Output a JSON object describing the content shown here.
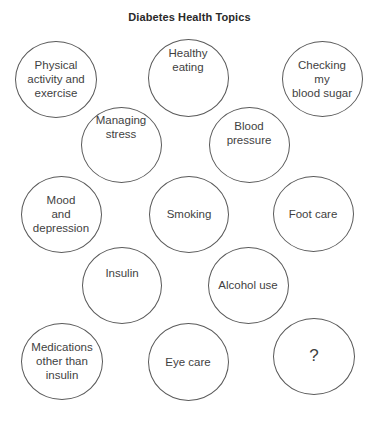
{
  "title": "Diabetes Health Topics",
  "colors": {
    "background": "#ffffff",
    "circle_stroke": "#5a5a5a",
    "text": "#3f3f3f",
    "title": "#2a2a2a"
  },
  "topics": [
    {
      "id": "physical-activity",
      "label": "Physical\nactivity and\nexercise",
      "cx": 56,
      "cy": 79,
      "w": 82,
      "h": 77,
      "pad_top": 0
    },
    {
      "id": "healthy-eating",
      "label": "Healthy\neating",
      "cx": 188,
      "cy": 78,
      "w": 81,
      "h": 78,
      "pad_top": -18
    },
    {
      "id": "checking-blood-sugar",
      "label": "Checking\nmy\nblood sugar",
      "cx": 322,
      "cy": 79,
      "w": 81,
      "h": 76,
      "pad_top": 0
    },
    {
      "id": "managing-stress",
      "label": "Managing\nstress",
      "cx": 121,
      "cy": 145,
      "w": 81,
      "h": 76,
      "pad_top": -18
    },
    {
      "id": "blood-pressure",
      "label": "Blood\npressure",
      "cx": 249,
      "cy": 145,
      "w": 81,
      "h": 76,
      "pad_top": -12
    },
    {
      "id": "mood-depression",
      "label": "Mood\nand\ndepression",
      "cx": 61,
      "cy": 214,
      "w": 81,
      "h": 77,
      "pad_top": 0
    },
    {
      "id": "smoking",
      "label": "Smoking",
      "cx": 189,
      "cy": 214,
      "w": 80,
      "h": 77,
      "pad_top": 0
    },
    {
      "id": "foot-care",
      "label": "Foot care",
      "cx": 313,
      "cy": 214,
      "w": 81,
      "h": 76,
      "pad_top": 0
    },
    {
      "id": "insulin",
      "label": "Insulin",
      "cx": 122,
      "cy": 285,
      "w": 80,
      "h": 77,
      "pad_top": -12
    },
    {
      "id": "alcohol-use",
      "label": "Alcohol use",
      "cx": 248,
      "cy": 285,
      "w": 81,
      "h": 77,
      "pad_top": 0
    },
    {
      "id": "medications-other-than-insulin",
      "label": "Medications\nother than\ninsulin",
      "cx": 62,
      "cy": 361,
      "w": 82,
      "h": 77,
      "pad_top": 0
    },
    {
      "id": "eye-care",
      "label": "Eye care",
      "cx": 188,
      "cy": 362,
      "w": 81,
      "h": 78,
      "pad_top": 0
    },
    {
      "id": "unknown-topic",
      "label": "?",
      "cx": 314,
      "cy": 356,
      "w": 82,
      "h": 77,
      "pad_top": 0
    }
  ]
}
